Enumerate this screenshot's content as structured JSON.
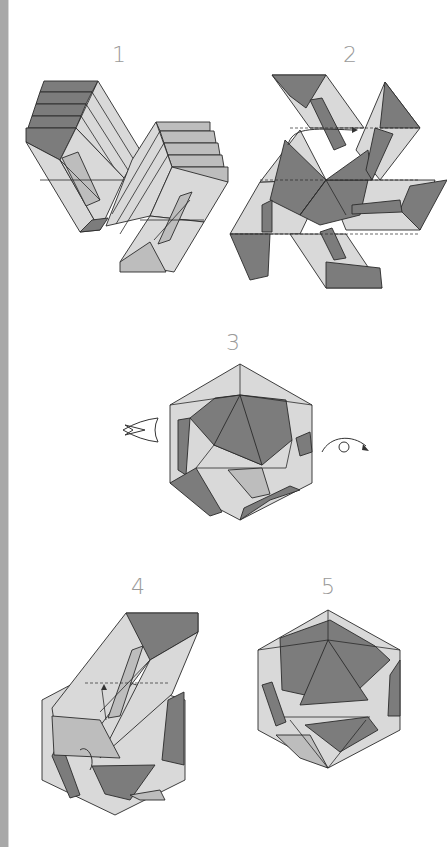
{
  "page": {
    "background": "#ffffff",
    "side_strip_color": "#a8a8a8",
    "diagram_colors": {
      "light": "#d9d9d9",
      "medium": "#bdbdbd",
      "dark": "#7c7c7c",
      "line": "#2a2a2a",
      "step_number": "#9a9a9a"
    }
  },
  "steps": [
    {
      "number": "1",
      "description": "two accordion-pleated folded units"
    },
    {
      "number": "2",
      "description": "units interlocked into star shape with arrow"
    },
    {
      "number": "3",
      "description": "partially assembled icosahedron with view arrow and turn-over arrow"
    },
    {
      "number": "4",
      "description": "inserting final unit with arrows"
    },
    {
      "number": "5",
      "description": "finished icosahedron"
    }
  ],
  "symbols": {
    "view_arrow": "hollow push arrow (step 3, left)",
    "turn_over_arrow": "turn model over (step 3, right)"
  }
}
